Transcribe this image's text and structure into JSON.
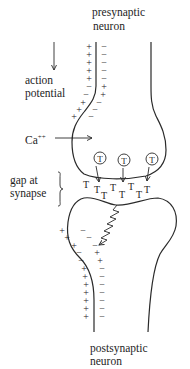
{
  "labels": {
    "presynaptic_line1": "presynaptic",
    "presynaptic_line2": "neuron",
    "action_line1": "action",
    "action_line2": "potential",
    "calcium": "Ca",
    "calcium_charge": "++",
    "gap_line1": "gap at",
    "gap_line2": "synapse",
    "postsynaptic_line1": "postsynaptic",
    "postsynaptic_line2": "neuron"
  },
  "symbols": {
    "plus": "+",
    "minus": "−",
    "transmitter": "T"
  },
  "colors": {
    "ink": "#2a2a2a",
    "background": "#ffffff"
  }
}
